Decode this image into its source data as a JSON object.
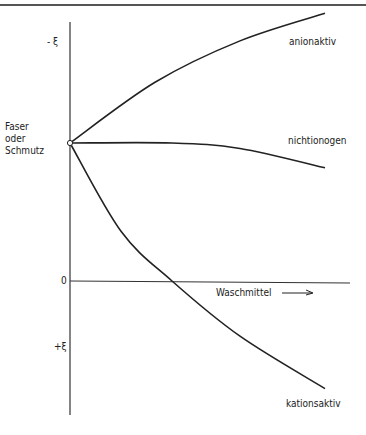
{
  "chart_data": {
    "type": "line",
    "title": "",
    "xlabel": "Waschmittel",
    "xlabel_arrow": "→",
    "ylabel": "Faser oder Schmutz",
    "ylabel_lines": [
      "Faser",
      "oder",
      "Schmutz"
    ],
    "y_tick_labels": {
      "top": "- ξ",
      "zero": "0",
      "bottom": "+ξ"
    },
    "y_axis_note": "zeta potential; negative up, positive down",
    "start_point": {
      "x": 0,
      "y": -0.5
    },
    "series": [
      {
        "name": "anionaktiv",
        "points": [
          [
            0,
            -0.5
          ],
          [
            0.25,
            -0.72
          ],
          [
            0.5,
            -0.87
          ],
          [
            0.75,
            -0.97
          ]
        ]
      },
      {
        "name": "nichtionogen",
        "points": [
          [
            0,
            -0.5
          ],
          [
            0.3,
            -0.5
          ],
          [
            0.5,
            -0.48
          ],
          [
            0.75,
            -0.41
          ]
        ]
      },
      {
        "name": "kationsaktiv",
        "points": [
          [
            0,
            -0.5
          ],
          [
            0.15,
            -0.18
          ],
          [
            0.3,
            0.0
          ],
          [
            0.5,
            0.2
          ],
          [
            0.75,
            0.39
          ]
        ]
      }
    ],
    "xlim": [
      0,
      1
    ],
    "ylim": [
      -1.1,
      0.6
    ]
  }
}
